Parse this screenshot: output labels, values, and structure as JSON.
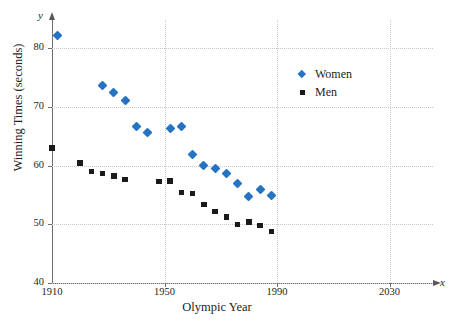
{
  "chart_data": {
    "type": "scatter",
    "title": "",
    "xlabel": "Olympic Year",
    "ylabel": "Winning Times (seconds)",
    "x_axis_variable": "x",
    "y_axis_variable": "y",
    "xlim": [
      1910,
      2040
    ],
    "ylim": [
      40,
      85
    ],
    "xticks": [
      1910,
      1950,
      1990,
      2030
    ],
    "xtick_labels": [
      "1910",
      "1950",
      "1990",
      "2030"
    ],
    "yticks": [
      40,
      50,
      60,
      70,
      80
    ],
    "ytick_labels": [
      "40",
      "50",
      "60",
      "70",
      "80"
    ],
    "grid": true,
    "grid_style": "dotted",
    "legend_position": "upper right",
    "series": [
      {
        "name": "Women",
        "marker": "diamond",
        "color": "#2574c4",
        "points": [
          [
            1912,
            82.2
          ],
          [
            1928,
            73.6
          ],
          [
            1932,
            72.4
          ],
          [
            1936,
            71.0
          ],
          [
            1940,
            66.7
          ],
          [
            1944,
            65.7
          ],
          [
            1952,
            66.3
          ],
          [
            1956,
            66.6
          ],
          [
            1960,
            61.8
          ],
          [
            1964,
            60.0
          ],
          [
            1968,
            59.5
          ],
          [
            1972,
            58.6
          ],
          [
            1976,
            57.0
          ],
          [
            1980,
            54.8
          ],
          [
            1984,
            55.9
          ],
          [
            1988,
            54.9
          ]
        ]
      },
      {
        "name": "Men",
        "marker": "square",
        "color": "#1a1a1a",
        "points": [
          [
            1910,
            63.0
          ],
          [
            1920,
            60.4
          ],
          [
            1924,
            59.0
          ],
          [
            1928,
            58.6
          ],
          [
            1932,
            58.2
          ],
          [
            1936,
            57.6
          ],
          [
            1948,
            57.3
          ],
          [
            1952,
            57.4
          ],
          [
            1956,
            55.4
          ],
          [
            1960,
            55.2
          ],
          [
            1964,
            53.4
          ],
          [
            1968,
            52.2
          ],
          [
            1972,
            51.2
          ],
          [
            1976,
            50.0
          ],
          [
            1980,
            50.4
          ],
          [
            1984,
            49.8
          ],
          [
            1988,
            48.8
          ]
        ]
      }
    ]
  }
}
